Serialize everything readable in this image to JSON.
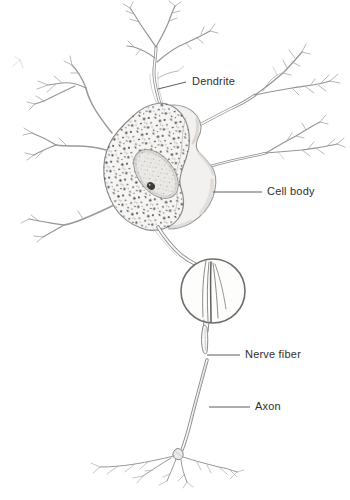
{
  "figure": {
    "type": "anatomical-diagram",
    "labels": {
      "dendrite": "Dendrite",
      "cell_body": "Cell body",
      "nerve_fiber": "Nerve fiber",
      "axon": "Axon"
    },
    "colors": {
      "background": "#ffffff",
      "sketch_line": "#8d8d8d",
      "label_text": "#2f2f2f",
      "leader_line": "#4a4a4a"
    }
  }
}
